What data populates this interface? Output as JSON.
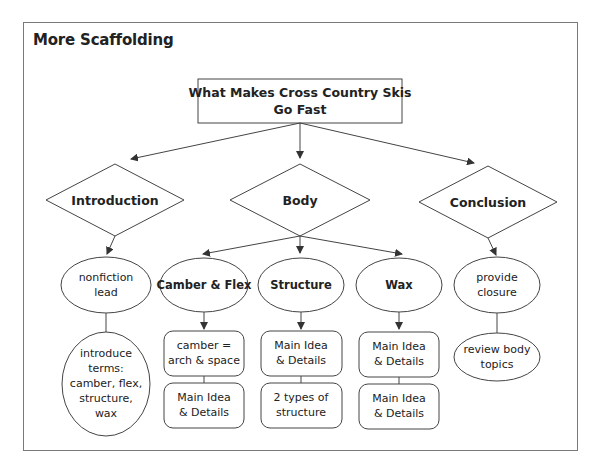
{
  "title": "More Scaffolding",
  "root": {
    "lines": [
      "What Makes Cross Country Skis",
      "Go Fast"
    ]
  },
  "sections": [
    {
      "label": "Introduction"
    },
    {
      "label": "Body"
    },
    {
      "label": "Conclusion"
    }
  ],
  "introduction": {
    "oval1": [
      "nonfiction",
      "lead"
    ],
    "oval2": [
      "introduce",
      "terms:",
      "camber, flex,",
      "structure,",
      "wax"
    ]
  },
  "body": {
    "topics": [
      {
        "label": "Camber & Flex",
        "box1": [
          "camber =",
          "arch & space"
        ],
        "box2": [
          "Main Idea",
          "& Details"
        ]
      },
      {
        "label": "Structure",
        "box1": [
          "Main Idea",
          "& Details"
        ],
        "box2": [
          "2 types of",
          "structure"
        ]
      },
      {
        "label": "Wax",
        "box1": [
          "Main Idea",
          "& Details"
        ],
        "box2": [
          "Main Idea",
          "& Details"
        ]
      }
    ]
  },
  "conclusion": {
    "oval1": [
      "provide",
      "closure"
    ],
    "oval2": [
      "review body",
      "topics"
    ]
  },
  "colors": {
    "stroke": "#444444",
    "frame": "#7a7a7a",
    "text": "#222222",
    "background": "#ffffff"
  }
}
